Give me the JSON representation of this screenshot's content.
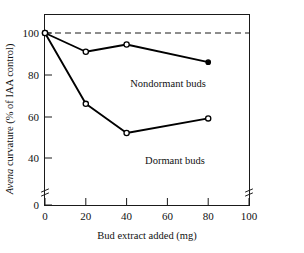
{
  "chart_data": {
    "type": "line",
    "title": "",
    "xlabel": "Bud extract added (mg)",
    "ylabel": "Avena curvature (% of IAA control)",
    "ylabel_italic_part": "Avena",
    "ylabel_rest": " curvature (% of IAA control)",
    "xlim": [
      0,
      100
    ],
    "ylim": [
      0,
      105
    ],
    "y_axis_break": true,
    "y_break_between": [
      0,
      40
    ],
    "x_axis_break_marks": true,
    "grid": false,
    "legend": "inline-annotations",
    "xticks": [
      "0",
      "20",
      "40",
      "60",
      "80",
      "100"
    ],
    "xtick_values": [
      0,
      20,
      40,
      60,
      80,
      100
    ],
    "yticks": [
      "0",
      "40",
      "60",
      "80",
      "100"
    ],
    "ytick_values": [
      0,
      40,
      60,
      80,
      100
    ],
    "annotations": [
      {
        "text": "Nondormant buds",
        "x": 52,
        "y": 83
      },
      {
        "text": "Dormant buds",
        "x": 52,
        "y": 49
      }
    ],
    "reference_line": {
      "y": 100,
      "style": "dashed",
      "label": ""
    },
    "series": [
      {
        "name": "Nondormant buds",
        "marker": "open-circle",
        "last_marker": "filled-circle",
        "x": [
          0,
          20,
          40,
          80
        ],
        "values": [
          100,
          91,
          94.5,
          86
        ]
      },
      {
        "name": "Dormant buds",
        "marker": "open-circle",
        "last_marker": "open-circle",
        "x": [
          0,
          20,
          40,
          80
        ],
        "values": [
          100,
          66,
          52,
          59
        ]
      }
    ]
  },
  "colors": {
    "line": "#000000",
    "axis": "#1a1a1a",
    "background": "#ffffff",
    "marker_fill": "#ffffff"
  }
}
